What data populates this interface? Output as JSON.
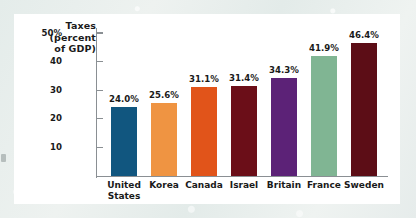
{
  "figure": {
    "background_color": "#e8eeec",
    "panel_color": "#ffffff",
    "axis_color": "#8a8f93",
    "text_color": "#1a1a1a"
  },
  "axis_title_lines": [
    "Taxes",
    "(percent",
    "of GDP)"
  ],
  "chart_data": {
    "type": "bar",
    "title": "Taxes (percent of GDP)",
    "xlabel": "",
    "ylabel": "Taxes (percent of GDP)",
    "ylim": [
      0,
      52
    ],
    "grid": false,
    "legend": "none",
    "yticks": [
      10,
      20,
      30,
      40,
      50
    ],
    "ytick_labels": [
      "10",
      "20",
      "30",
      "40",
      "50%"
    ],
    "categories": [
      "United States",
      "Korea",
      "Canada",
      "Israel",
      "Britain",
      "France",
      "Sweden"
    ],
    "category_label_lines": [
      [
        "United",
        "States"
      ],
      [
        "Korea"
      ],
      [
        "Canada"
      ],
      [
        "Israel"
      ],
      [
        "Britain"
      ],
      [
        "France"
      ],
      [
        "Sweden"
      ]
    ],
    "values": [
      24.0,
      25.6,
      31.1,
      31.4,
      34.3,
      41.9,
      46.4
    ],
    "value_labels": [
      "24.0%",
      "25.6%",
      "31.1%",
      "31.4%",
      "34.3%",
      "41.9%",
      "46.4%"
    ],
    "colors": [
      "#11567f",
      "#ef9442",
      "#e1541a",
      "#6b0e18",
      "#5c2277",
      "#80b593",
      "#5c0d16"
    ]
  }
}
